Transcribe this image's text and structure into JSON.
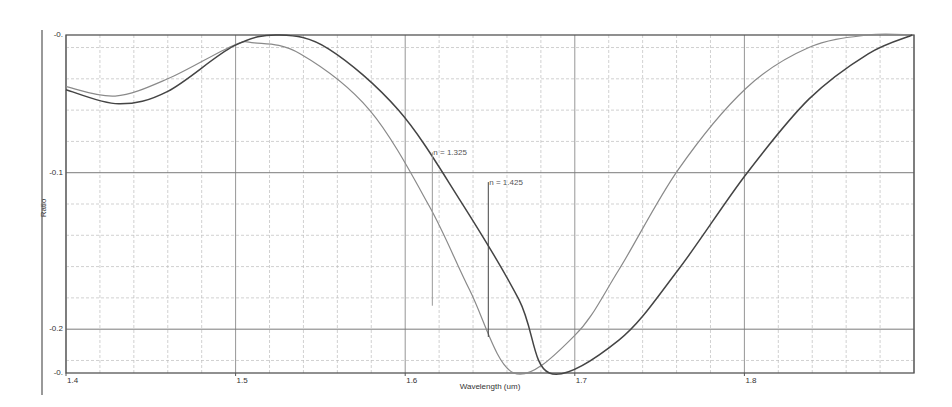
{
  "chart_data": {
    "type": "line",
    "title": "",
    "xlabel": "Wavelength (um)",
    "ylabel": "Ratio",
    "xlim": [
      1.4,
      1.9
    ],
    "ylim": [
      -0.228,
      -0.012
    ],
    "grid": true,
    "legend": "none",
    "x_ticks": [
      {
        "value": 1.4,
        "label": "1.4"
      },
      {
        "value": 1.5,
        "label": "1.5"
      },
      {
        "value": 1.6,
        "label": "1.6"
      },
      {
        "value": 1.7,
        "label": "1.7"
      },
      {
        "value": 1.8,
        "label": "1.8"
      }
    ],
    "y_ticks": [
      {
        "value": -0.012,
        "label": "-0."
      },
      {
        "value": -0.1,
        "label": "-0.1"
      },
      {
        "value": -0.2,
        "label": "-0.2"
      },
      {
        "value": -0.228,
        "label": "-0."
      }
    ],
    "series": [
      {
        "name": "n = 1.325",
        "color": "#8a8a8a",
        "x": [
          1.4,
          1.429,
          1.46,
          1.498,
          1.511,
          1.538,
          1.579,
          1.614,
          1.638,
          1.664,
          1.7,
          1.726,
          1.761,
          1.801,
          1.838,
          1.873,
          1.899
        ],
        "values": [
          -0.045,
          -0.051,
          -0.04,
          -0.019,
          -0.017,
          -0.024,
          -0.06,
          -0.121,
          -0.175,
          -0.228,
          -0.204,
          -0.162,
          -0.098,
          -0.046,
          -0.02,
          -0.012,
          -0.012
        ]
      },
      {
        "name": "n = 1.425",
        "color": "#444444",
        "x": [
          1.4,
          1.431,
          1.46,
          1.499,
          1.526,
          1.555,
          1.596,
          1.632,
          1.667,
          1.685,
          1.726,
          1.761,
          1.801,
          1.838,
          1.873,
          1.899
        ],
        "values": [
          -0.047,
          -0.056,
          -0.048,
          -0.019,
          -0.012,
          -0.021,
          -0.06,
          -0.117,
          -0.181,
          -0.228,
          -0.207,
          -0.162,
          -0.101,
          -0.053,
          -0.024,
          -0.012
        ]
      }
    ],
    "annotations": [
      {
        "text": "n = 1.325",
        "x": 1.616,
        "y_top": -0.087,
        "y_bottom": -0.185
      },
      {
        "text": "n = 1.425",
        "x": 1.649,
        "y_top": -0.106,
        "y_bottom": -0.205
      }
    ]
  }
}
